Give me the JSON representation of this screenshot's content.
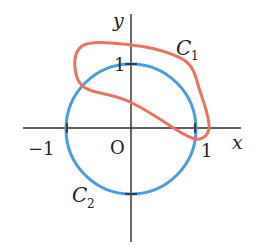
{
  "diagram": {
    "axes": {
      "x_label": "x",
      "y_label": "y",
      "origin_label": "O",
      "tick_labels": {
        "x_neg1": "−1",
        "x_pos1": "1",
        "y_pos1": "1"
      }
    },
    "curves": [
      {
        "name": "C",
        "subscript": "1",
        "description": "closed irregular loop",
        "color": "#e8735f"
      },
      {
        "name": "C",
        "subscript": "2",
        "description": "unit circle centered at origin",
        "color": "#4a9be0"
      }
    ]
  }
}
